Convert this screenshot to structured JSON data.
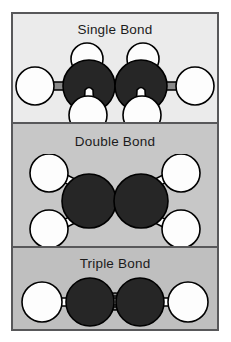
{
  "figure": {
    "background_color": "#ffffff",
    "frame_border_color": "#58585a"
  },
  "colors": {
    "carbon_fill": "#262626",
    "carbon_stroke": "#000000",
    "hydrogen_fill": "#fdfdfd",
    "hydrogen_stroke": "#000000",
    "bond_fill": "#8a8a8a",
    "bond_stroke": "#000000",
    "panel_single_bg": "#ebebeb",
    "panel_double_bg": "#c7c7c7",
    "panel_triple_bg": "#bfbfbf",
    "text_color": "#1b1b1b"
  },
  "panels": [
    {
      "id": "single",
      "label": "Single Bond",
      "molecule_name": "ethane",
      "bond_count": 1,
      "carbon_count": 2,
      "hydrogen_count": 6,
      "background_color": "#ebebeb"
    },
    {
      "id": "double",
      "label": "Double Bond",
      "molecule_name": "ethene",
      "bond_count": 2,
      "carbon_count": 2,
      "hydrogen_count": 4,
      "background_color": "#c7c7c7"
    },
    {
      "id": "triple",
      "label": "Triple Bond",
      "molecule_name": "ethyne",
      "bond_count": 3,
      "carbon_count": 2,
      "hydrogen_count": 2,
      "background_color": "#bfbfbf"
    }
  ]
}
